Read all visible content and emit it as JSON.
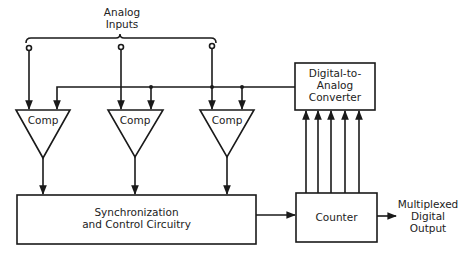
{
  "title_label": {
    "line1": "Analog",
    "line2": "Inputs"
  },
  "comparators": [
    {
      "label": "Comp"
    },
    {
      "label": "Comp"
    },
    {
      "label": "Comp"
    }
  ],
  "dac": {
    "line1": "Digital-to-",
    "line2": "Analog",
    "line3": "Converter"
  },
  "sync": {
    "line1": "Synchronization",
    "line2": "and Control Circuitry"
  },
  "counter": {
    "label": "Counter"
  },
  "output": {
    "line1": "Multiplexed",
    "line2": "Digital",
    "line3": "Output"
  },
  "colors": {
    "line": "#1a1a1a",
    "background": "#ffffff"
  }
}
